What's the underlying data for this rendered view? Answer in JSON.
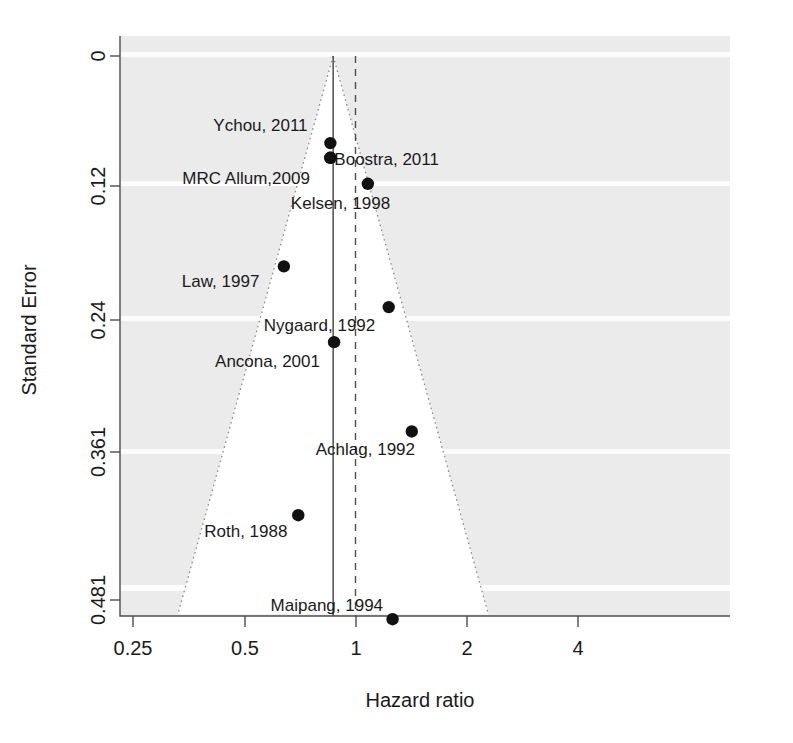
{
  "chart_data": {
    "type": "scatter",
    "title": "",
    "subtitle": "",
    "xlabel": "Hazard ratio",
    "ylabel": "Standard Error",
    "x_scale": "log",
    "x_ticks": [
      0.25,
      0.5,
      1,
      2,
      4
    ],
    "x_tick_labels": [
      "0.25",
      "0.5",
      "1",
      "2",
      "4"
    ],
    "xlim": [
      0.2,
      5.0
    ],
    "y_ticks": [
      0,
      0.12,
      0.24,
      0.361,
      0.481
    ],
    "y_tick_labels": [
      "0",
      "0.12",
      "0.24",
      "0.361",
      "0.481"
    ],
    "ylim": [
      0,
      0.51
    ],
    "y_inverted": true,
    "grid": false,
    "legend": "none",
    "reference_lines": [
      {
        "name": "pooled-effect-line",
        "style": "solid",
        "hazard_ratio": 0.87
      },
      {
        "name": "null-effect-line",
        "style": "dashed",
        "hazard_ratio": 1.0
      }
    ],
    "funnel": {
      "apex_hazard_ratio": 0.87,
      "apex_standard_error": 0,
      "style": "dotted",
      "confidence": 0.95
    },
    "points": [
      {
        "label": "Ychou, 2011",
        "hazard_ratio": 0.855,
        "standard_error": 0.077,
        "label_dx": -117,
        "label_dy": -12
      },
      {
        "label": "Boostra, 2011",
        "hazard_ratio": 0.855,
        "standard_error": 0.09,
        "label_dx": 4,
        "label_dy": 7
      },
      {
        "label": "MRC Allum,2009",
        "hazard_ratio": 0.855,
        "standard_error": 0.09,
        "label_dx": -148,
        "label_dy": 26
      },
      {
        "label": "Kelsen, 1998",
        "hazard_ratio": 1.08,
        "standard_error": 0.113,
        "label_dx": -77,
        "label_dy": 25
      },
      {
        "label": "Law, 1997",
        "hazard_ratio": 0.64,
        "standard_error": 0.186,
        "label_dx": -102,
        "label_dy": 21
      },
      {
        "label": "Nygaard, 1992",
        "hazard_ratio": 1.23,
        "standard_error": 0.222,
        "label_dx": -125,
        "label_dy": 24
      },
      {
        "label": "Ancona, 2001",
        "hazard_ratio": 0.875,
        "standard_error": 0.253,
        "label_dx": -119,
        "label_dy": 25
      },
      {
        "label": "Achlag, 1992",
        "hazard_ratio": 1.42,
        "standard_error": 0.332,
        "label_dx": -96,
        "label_dy": 24
      },
      {
        "label": "Roth, 1988",
        "hazard_ratio": 0.7,
        "standard_error": 0.406,
        "label_dx": -94,
        "label_dy": 22
      },
      {
        "label": "Maipang, 1994",
        "hazard_ratio": 1.26,
        "standard_error": 0.498,
        "label_dx": -122,
        "label_dy": -8
      }
    ]
  },
  "style": {
    "background_outside_funnel": "#ebebeb",
    "background_inside_funnel": "#ffffff",
    "point_color": "#111111",
    "axis_color": "#4d4d4d",
    "funnel_edge_color": "#8c8c8c"
  }
}
